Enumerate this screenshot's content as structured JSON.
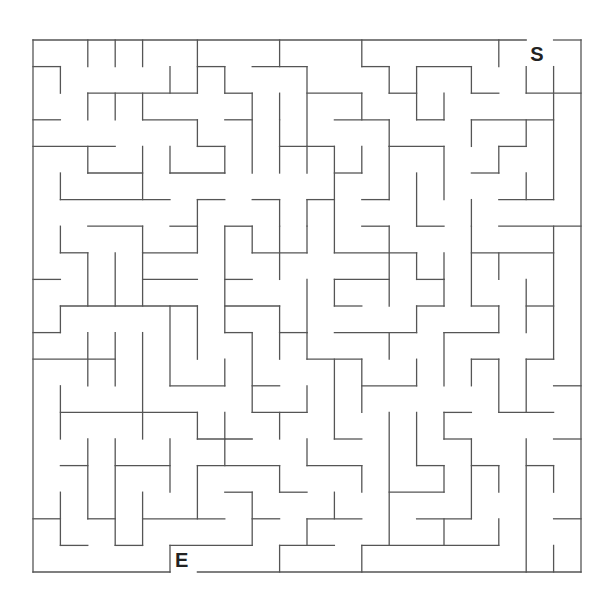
{
  "maze": {
    "cols": 20,
    "rows": 20,
    "origin": [
      33,
      40
    ],
    "cell": [
      27.4,
      26.6
    ],
    "wall_color": "#555555",
    "start": {
      "label": "S",
      "col": 18,
      "row": 0
    },
    "end": {
      "label": "E",
      "col": 5,
      "row": 19
    },
    "h": [
      [
        0,
        0,
        18
      ],
      [
        0,
        19,
        20
      ],
      [
        1,
        0,
        1
      ],
      [
        1,
        6,
        7
      ],
      [
        1,
        8,
        10
      ],
      [
        1,
        12,
        13
      ],
      [
        1,
        14,
        16
      ],
      [
        2,
        2,
        6
      ],
      [
        2,
        7,
        8
      ],
      [
        2,
        10,
        12
      ],
      [
        2,
        13,
        14
      ],
      [
        2,
        16,
        17
      ],
      [
        2,
        18,
        20
      ],
      [
        3,
        0,
        1
      ],
      [
        3,
        4,
        6
      ],
      [
        3,
        7,
        8
      ],
      [
        3,
        11,
        13
      ],
      [
        3,
        14,
        15
      ],
      [
        3,
        16,
        19
      ],
      [
        4,
        0,
        3
      ],
      [
        4,
        6,
        7
      ],
      [
        4,
        9,
        11
      ],
      [
        4,
        13,
        15
      ],
      [
        4,
        17,
        18
      ],
      [
        5,
        2,
        4
      ],
      [
        5,
        5,
        7
      ],
      [
        5,
        11,
        12
      ],
      [
        5,
        16,
        17
      ],
      [
        6,
        1,
        5
      ],
      [
        6,
        6,
        7
      ],
      [
        6,
        8,
        9
      ],
      [
        6,
        10,
        11
      ],
      [
        6,
        12,
        13
      ],
      [
        6,
        17,
        19
      ],
      [
        7,
        2,
        4
      ],
      [
        7,
        5,
        6
      ],
      [
        7,
        7,
        8
      ],
      [
        7,
        12,
        13
      ],
      [
        7,
        14,
        15
      ],
      [
        7,
        17,
        20
      ],
      [
        8,
        1,
        2
      ],
      [
        8,
        4,
        6
      ],
      [
        8,
        8,
        10
      ],
      [
        8,
        11,
        14
      ],
      [
        8,
        16,
        19
      ],
      [
        9,
        0,
        1
      ],
      [
        9,
        4,
        6
      ],
      [
        9,
        7,
        8
      ],
      [
        9,
        11,
        13
      ],
      [
        9,
        14,
        15
      ],
      [
        10,
        1,
        6
      ],
      [
        10,
        7,
        9
      ],
      [
        10,
        11,
        12
      ],
      [
        10,
        14,
        15
      ],
      [
        10,
        16,
        17
      ],
      [
        10,
        18,
        19
      ],
      [
        11,
        0,
        1
      ],
      [
        11,
        7,
        8
      ],
      [
        11,
        9,
        10
      ],
      [
        11,
        11,
        14
      ],
      [
        11,
        15,
        17
      ],
      [
        12,
        0,
        3
      ],
      [
        12,
        10,
        12
      ],
      [
        12,
        16,
        17
      ],
      [
        12,
        18,
        19
      ],
      [
        13,
        5,
        7
      ],
      [
        13,
        8,
        9
      ],
      [
        13,
        12,
        14
      ],
      [
        13,
        19,
        20
      ],
      [
        14,
        1,
        6
      ],
      [
        14,
        8,
        10
      ],
      [
        14,
        15,
        16
      ],
      [
        14,
        17,
        19
      ],
      [
        15,
        6,
        8
      ],
      [
        15,
        11,
        12
      ],
      [
        15,
        15,
        16
      ],
      [
        15,
        19,
        20
      ],
      [
        16,
        1,
        2
      ],
      [
        16,
        3,
        5
      ],
      [
        16,
        6,
        9
      ],
      [
        16,
        10,
        12
      ],
      [
        16,
        14,
        15
      ],
      [
        16,
        16,
        17
      ],
      [
        16,
        18,
        19
      ],
      [
        17,
        7,
        8
      ],
      [
        17,
        9,
        10
      ],
      [
        17,
        13,
        15
      ],
      [
        18,
        0,
        1
      ],
      [
        18,
        2,
        3
      ],
      [
        18,
        4,
        7
      ],
      [
        18,
        8,
        9
      ],
      [
        18,
        10,
        12
      ],
      [
        18,
        14,
        16
      ],
      [
        18,
        19,
        20
      ],
      [
        19,
        1,
        2
      ],
      [
        19,
        3,
        4
      ],
      [
        19,
        5,
        8
      ],
      [
        19,
        9,
        11
      ],
      [
        19,
        12,
        17
      ],
      [
        20,
        0,
        5
      ],
      [
        20,
        6,
        20
      ]
    ],
    "v": [
      [
        0,
        0,
        20
      ],
      [
        20,
        0,
        20
      ],
      [
        2,
        0,
        1
      ],
      [
        3,
        0,
        1
      ],
      [
        4,
        0,
        1
      ],
      [
        6,
        0,
        2
      ],
      [
        9,
        0,
        1
      ],
      [
        12,
        0,
        1
      ],
      [
        17,
        0,
        1
      ],
      [
        1,
        1,
        2
      ],
      [
        5,
        1,
        2
      ],
      [
        7,
        1,
        2
      ],
      [
        10,
        1,
        4
      ],
      [
        13,
        1,
        2
      ],
      [
        14,
        1,
        3
      ],
      [
        16,
        1,
        2
      ],
      [
        18,
        1,
        2
      ],
      [
        19,
        1,
        6
      ],
      [
        2,
        2,
        3
      ],
      [
        3,
        2,
        3
      ],
      [
        4,
        2,
        3
      ],
      [
        8,
        2,
        5
      ],
      [
        9,
        2,
        3
      ],
      [
        12,
        2,
        3
      ],
      [
        15,
        2,
        3
      ],
      [
        6,
        3,
        4
      ],
      [
        9,
        3,
        4
      ],
      [
        13,
        3,
        4
      ],
      [
        16,
        3,
        4
      ],
      [
        18,
        3,
        4
      ],
      [
        2,
        4,
        5
      ],
      [
        4,
        4,
        6
      ],
      [
        5,
        4,
        5
      ],
      [
        7,
        4,
        5
      ],
      [
        9,
        4,
        5
      ],
      [
        10,
        4,
        5
      ],
      [
        11,
        4,
        8
      ],
      [
        12,
        4,
        5
      ],
      [
        13,
        4,
        6
      ],
      [
        15,
        4,
        6
      ],
      [
        17,
        4,
        5
      ],
      [
        1,
        5,
        6
      ],
      [
        14,
        5,
        7
      ],
      [
        18,
        5,
        6
      ],
      [
        6,
        6,
        7
      ],
      [
        9,
        6,
        7
      ],
      [
        10,
        6,
        7
      ],
      [
        16,
        6,
        7
      ],
      [
        1,
        7,
        8
      ],
      [
        4,
        7,
        8
      ],
      [
        6,
        7,
        8
      ],
      [
        7,
        7,
        11
      ],
      [
        8,
        7,
        8
      ],
      [
        9,
        7,
        9
      ],
      [
        10,
        7,
        8
      ],
      [
        13,
        7,
        10
      ],
      [
        16,
        7,
        10
      ],
      [
        19,
        7,
        12
      ],
      [
        2,
        8,
        10
      ],
      [
        3,
        8,
        10
      ],
      [
        4,
        8,
        10
      ],
      [
        14,
        8,
        9
      ],
      [
        15,
        8,
        9
      ],
      [
        17,
        8,
        9
      ],
      [
        10,
        9,
        11
      ],
      [
        11,
        9,
        10
      ],
      [
        15,
        9,
        10
      ],
      [
        18,
        9,
        11
      ],
      [
        1,
        10,
        11
      ],
      [
        5,
        10,
        13
      ],
      [
        6,
        10,
        12
      ],
      [
        9,
        10,
        11
      ],
      [
        14,
        10,
        11
      ],
      [
        17,
        10,
        11
      ],
      [
        2,
        11,
        13
      ],
      [
        3,
        11,
        13
      ],
      [
        4,
        11,
        15
      ],
      [
        8,
        11,
        14
      ],
      [
        9,
        11,
        12
      ],
      [
        10,
        11,
        12
      ],
      [
        13,
        11,
        12
      ],
      [
        15,
        11,
        13
      ],
      [
        7,
        12,
        13
      ],
      [
        11,
        12,
        15
      ],
      [
        12,
        12,
        14
      ],
      [
        14,
        12,
        13
      ],
      [
        16,
        12,
        13
      ],
      [
        17,
        12,
        14
      ],
      [
        18,
        12,
        14
      ],
      [
        1,
        13,
        15
      ],
      [
        10,
        13,
        14
      ],
      [
        6,
        14,
        15
      ],
      [
        7,
        14,
        15
      ],
      [
        9,
        14,
        15
      ],
      [
        13,
        14,
        19
      ],
      [
        14,
        14,
        16
      ],
      [
        15,
        14,
        15
      ],
      [
        2,
        15,
        18
      ],
      [
        3,
        15,
        19
      ],
      [
        5,
        15,
        17
      ],
      [
        7,
        15,
        16
      ],
      [
        10,
        15,
        16
      ],
      [
        16,
        15,
        18
      ],
      [
        18,
        15,
        20
      ],
      [
        6,
        16,
        18
      ],
      [
        9,
        16,
        17
      ],
      [
        12,
        16,
        17
      ],
      [
        15,
        16,
        17
      ],
      [
        17,
        16,
        17
      ],
      [
        19,
        16,
        17
      ],
      [
        1,
        17,
        19
      ],
      [
        4,
        17,
        19
      ],
      [
        8,
        17,
        19
      ],
      [
        11,
        17,
        18
      ],
      [
        10,
        18,
        19
      ],
      [
        15,
        18,
        19
      ],
      [
        17,
        18,
        19
      ],
      [
        5,
        19,
        20
      ],
      [
        9,
        19,
        20
      ],
      [
        12,
        19,
        20
      ],
      [
        19,
        19,
        20
      ]
    ]
  }
}
